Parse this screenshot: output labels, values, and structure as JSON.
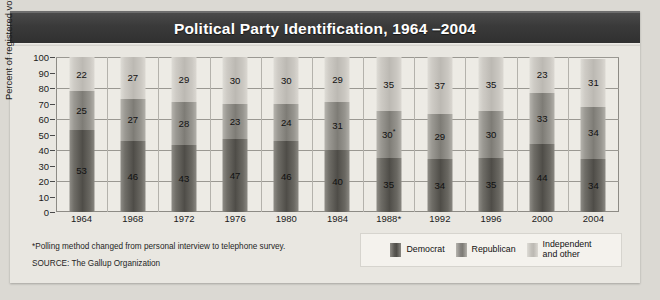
{
  "title": "Political Party Identification, 1964 –2004",
  "yaxis_label": "Percent of registered voters",
  "footnote": "*Polling method changed from personal interview to telephone survey.",
  "source": "SOURCE: The Gallup Organization",
  "legend": [
    {
      "key": "democrat",
      "label": "Democrat",
      "color": "#4f4d48"
    },
    {
      "key": "republican",
      "label": "Republican",
      "color": "#7e7c76"
    },
    {
      "key": "independent",
      "label_line1": "Independent",
      "label_line2": "and other",
      "color": "#bcb9b3"
    }
  ],
  "chart_data": {
    "type": "bar",
    "stacked": true,
    "title": "Political Party Identification, 1964 –2004",
    "xlabel": "",
    "ylabel": "Percent of registered voters",
    "ylim": [
      0,
      100
    ],
    "yticks": [
      0,
      10,
      20,
      30,
      40,
      50,
      60,
      70,
      80,
      90,
      100
    ],
    "gridlines": [
      20,
      40,
      60,
      80,
      100
    ],
    "grid": true,
    "legend_position": "bottom-right",
    "categories": [
      "1964",
      "1968",
      "1972",
      "1976",
      "1980",
      "1984",
      "1988*",
      "1992",
      "1996",
      "2000",
      "2004"
    ],
    "series": [
      {
        "name": "Democrat",
        "values": [
          53,
          46,
          43,
          47,
          46,
          40,
          35,
          34,
          35,
          44,
          34
        ]
      },
      {
        "name": "Republican",
        "values": [
          25,
          27,
          28,
          23,
          24,
          31,
          30,
          29,
          30,
          33,
          34
        ]
      },
      {
        "name": "Independent and other",
        "values": [
          22,
          27,
          29,
          30,
          30,
          29,
          35,
          37,
          35,
          23,
          31
        ]
      }
    ],
    "data_labels": {
      "1964": {
        "Democrat": "53",
        "Republican": "25",
        "Independent and other": "22"
      },
      "1968": {
        "Democrat": "46",
        "Republican": "27",
        "Independent and other": "27"
      },
      "1972": {
        "Democrat": "43",
        "Republican": "28",
        "Independent and other": "29"
      },
      "1976": {
        "Democrat": "47",
        "Republican": "23",
        "Independent and other": "30"
      },
      "1980": {
        "Democrat": "46",
        "Republican": "24",
        "Independent and other": "30"
      },
      "1984": {
        "Democrat": "40",
        "Republican": "31",
        "Independent and other": "29"
      },
      "1988*": {
        "Democrat": "35",
        "Republican": "30*",
        "Independent and other": "35"
      },
      "1992": {
        "Democrat": "34",
        "Republican": "29",
        "Independent and other": "37"
      },
      "1996": {
        "Democrat": "35",
        "Republican": "30",
        "Independent and other": "35"
      },
      "2000": {
        "Democrat": "44",
        "Republican": "33",
        "Independent and other": "23"
      },
      "2004": {
        "Democrat": "34",
        "Republican": "34",
        "Independent and other": "31"
      }
    },
    "annotations": [
      "*Polling method changed from personal interview to telephone survey.",
      "SOURCE: The Gallup Organization"
    ]
  }
}
